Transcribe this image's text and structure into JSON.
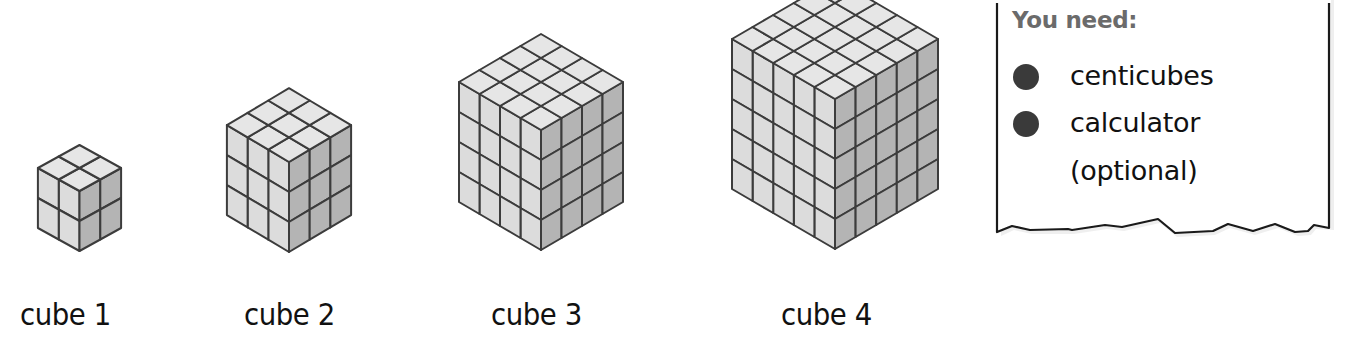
{
  "cubes": [
    {
      "label": "cube 1",
      "size": 2
    },
    {
      "label": "cube 2",
      "size": 3
    },
    {
      "label": "cube 3",
      "size": 4
    },
    {
      "label": "cube 4",
      "size": 5
    }
  ],
  "notepad": {
    "heading": "You need:",
    "items": [
      {
        "text": "centicubes",
        "bullet": true
      },
      {
        "text": "calculator",
        "bullet": true
      },
      {
        "text": "(optional)",
        "bullet": false
      }
    ]
  },
  "colors": {
    "top_face": "#e6e6e6",
    "left_face": "#dcdcdc",
    "right_face": "#b4b4b4",
    "edge": "#3c3c3c",
    "heading": "#6b6b6b"
  }
}
